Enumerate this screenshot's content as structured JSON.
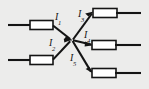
{
  "figure": {
    "kind": "circuit-junction-diagram",
    "background_color": "#ececeb",
    "line_color": "#141414",
    "box_fill_color": "#ffffff",
    "width": 149,
    "height": 89,
    "junction": {
      "x": 72,
      "y": 40
    }
  },
  "labels": {
    "i1": {
      "symbol": "I",
      "subscript": "1",
      "x": 55,
      "y": 12
    },
    "i2": {
      "symbol": "I",
      "subscript": "2",
      "x": 49,
      "y": 38
    },
    "i3": {
      "symbol": "I",
      "subscript": "3",
      "x": 78,
      "y": 9
    },
    "i4": {
      "symbol": "I",
      "subscript": "4",
      "x": 84,
      "y": 30
    },
    "i5": {
      "symbol": "I",
      "subscript": "5",
      "x": 70,
      "y": 53
    }
  },
  "branches": [
    {
      "id": "branch-i1",
      "label_key": "i1",
      "direction": "incoming",
      "lead": {
        "x1": 8,
        "y1": 25,
        "x2": 30,
        "y2": 25
      },
      "box": {
        "x": 30,
        "y": 20.5,
        "w": 23,
        "h": 9
      },
      "wire": {
        "x1": 53,
        "y1": 25,
        "x2": 72,
        "y2": 40
      },
      "arrow_at": "junction"
    },
    {
      "id": "branch-i2",
      "label_key": "i2",
      "direction": "incoming",
      "lead": {
        "x1": 8,
        "y1": 60,
        "x2": 30,
        "y2": 60
      },
      "box": {
        "x": 30,
        "y": 55.5,
        "w": 23,
        "h": 9
      },
      "wire": {
        "x1": 53,
        "y1": 60,
        "x2": 72,
        "y2": 40
      },
      "arrow_at": "junction"
    },
    {
      "id": "branch-i3",
      "label_key": "i3",
      "direction": "outgoing",
      "wire": {
        "x1": 72,
        "y1": 40,
        "x2": 93,
        "y2": 13
      },
      "box": {
        "x": 93,
        "y": 8.5,
        "w": 24,
        "h": 9
      },
      "lead": {
        "x1": 117,
        "y1": 13,
        "x2": 141,
        "y2": 13
      },
      "arrow_at": "box"
    },
    {
      "id": "branch-i4",
      "label_key": "i4",
      "direction": "outgoing",
      "wire": {
        "x1": 72,
        "y1": 40,
        "x2": 92,
        "y2": 45
      },
      "box": {
        "x": 92,
        "y": 40.5,
        "w": 24,
        "h": 9
      },
      "lead": {
        "x1": 116,
        "y1": 45,
        "x2": 141,
        "y2": 45
      },
      "arrow_at": "box"
    },
    {
      "id": "branch-i5",
      "label_key": "i5",
      "direction": "outgoing",
      "wire": {
        "x1": 72,
        "y1": 40,
        "x2": 92,
        "y2": 73
      },
      "box": {
        "x": 92,
        "y": 68.5,
        "w": 24,
        "h": 9
      },
      "lead": {
        "x1": 116,
        "y1": 73,
        "x2": 141,
        "y2": 73
      },
      "arrow_at": "box"
    }
  ]
}
